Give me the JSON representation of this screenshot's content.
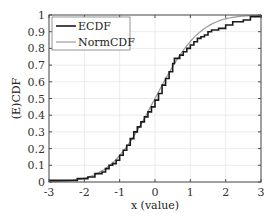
{
  "chart_data": {
    "type": "line",
    "title": "",
    "xlabel": "x (value)",
    "ylabel": "(E)CDF",
    "xlim": [
      -3,
      3
    ],
    "ylim": [
      0,
      1
    ],
    "grid": true,
    "legend_position": "upper left",
    "xticks": [
      -3,
      -2,
      -1,
      0,
      1,
      2,
      3
    ],
    "xtick_labels": [
      "-3",
      "-2",
      "-1",
      "0",
      "1",
      "2",
      "3"
    ],
    "yticks": [
      0,
      0.1,
      0.2,
      0.3,
      0.4,
      0.5,
      0.6,
      0.7,
      0.8,
      0.9,
      1
    ],
    "ytick_labels": [
      "0",
      "0.1",
      "0.2",
      "0.3",
      "0.4",
      "0.5",
      "0.6",
      "0.7",
      "0.8",
      "0.9",
      "1"
    ],
    "series": [
      {
        "name": "ECDF",
        "color": "#1a1a1a",
        "style": "step",
        "x": [
          -3.0,
          -2.2,
          -1.9,
          -1.7,
          -1.5,
          -1.4,
          -1.3,
          -1.2,
          -1.1,
          -1.0,
          -0.9,
          -0.8,
          -0.7,
          -0.6,
          -0.5,
          -0.4,
          -0.3,
          -0.2,
          -0.1,
          0.0,
          0.1,
          0.2,
          0.3,
          0.4,
          0.5,
          0.55,
          0.7,
          0.8,
          0.9,
          1.0,
          1.1,
          1.2,
          1.3,
          1.4,
          1.5,
          1.6,
          1.8,
          2.0,
          2.2,
          2.5,
          2.7,
          3.0
        ],
        "y": [
          0.01,
          0.02,
          0.03,
          0.05,
          0.06,
          0.08,
          0.1,
          0.11,
          0.13,
          0.16,
          0.19,
          0.22,
          0.26,
          0.3,
          0.33,
          0.36,
          0.39,
          0.42,
          0.45,
          0.49,
          0.53,
          0.58,
          0.62,
          0.66,
          0.71,
          0.74,
          0.76,
          0.78,
          0.8,
          0.82,
          0.84,
          0.86,
          0.87,
          0.88,
          0.9,
          0.91,
          0.92,
          0.94,
          0.96,
          0.97,
          0.99,
          1.0
        ]
      },
      {
        "name": "NormCDF",
        "color": "#9a9a9a",
        "style": "smooth",
        "x": [
          -3.0,
          -2.5,
          -2.0,
          -1.5,
          -1.0,
          -0.5,
          0.0,
          0.5,
          1.0,
          1.5,
          2.0,
          2.5,
          3.0
        ],
        "y": [
          0.001,
          0.006,
          0.023,
          0.067,
          0.159,
          0.309,
          0.5,
          0.691,
          0.841,
          0.933,
          0.977,
          0.994,
          0.999
        ]
      }
    ]
  }
}
